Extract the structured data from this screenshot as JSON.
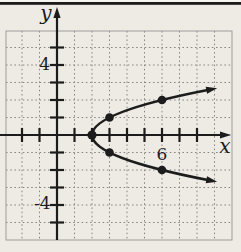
{
  "figure": {
    "width": 241,
    "height": 252,
    "colors": {
      "paper": "#eeebe4",
      "top_margin": "#f7f5f1",
      "ink": "#1c1c1c",
      "grid_dotted": "#878787",
      "plot_border": "#9d9d9d"
    },
    "top_rule": {
      "y": 2,
      "height": 2.8
    },
    "plot_box": {
      "left": 6,
      "top": 31,
      "right": 232,
      "bottom": 240
    },
    "origin_px": {
      "x": 57,
      "y": 135
    },
    "unit_px": 17.5,
    "axes_px": {
      "x_start": 0,
      "x_tip": 231,
      "y_tip": 7
    },
    "style": {
      "axis_width": 2.2,
      "tick_half_len": 7,
      "tick_width": 2.2,
      "curve_width": 2.8,
      "point_radius": 4.3,
      "vertex_radius": 4.6,
      "arrow_len": 11,
      "arrow_half_w": 3.6
    },
    "labels": [
      {
        "name": "y-axis-letter",
        "text": "y",
        "x": 46,
        "y": 20,
        "size": 20,
        "italic": true,
        "anchor": "middle"
      },
      {
        "name": "x-axis-letter",
        "text": "x",
        "x": 225,
        "y": 153,
        "size": 20,
        "italic": true,
        "anchor": "middle"
      },
      {
        "name": "y-tick-label-4",
        "text": "4",
        "x": 50,
        "y": 70,
        "size": 17,
        "italic": false,
        "anchor": "end"
      },
      {
        "name": "y-tick-label-neg4",
        "text": "-4",
        "x": 50.5,
        "y": 209,
        "size": 17,
        "italic": false,
        "anchor": "end"
      },
      {
        "name": "x-tick-label-6",
        "text": "6",
        "x": 162,
        "y": 160,
        "size": 17,
        "italic": false,
        "anchor": "middle"
      }
    ]
  },
  "chart_data": {
    "type": "line",
    "title": "",
    "xlabel": "x",
    "ylabel": "y",
    "xlim": [
      -3,
      10
    ],
    "ylim": [
      -6,
      6
    ],
    "grid": true,
    "grid_step": 1,
    "x_tick_values": [
      -2,
      -1,
      1,
      2,
      3,
      4,
      5,
      6,
      7,
      8
    ],
    "y_tick_values": [
      -5,
      -4,
      -3,
      -2,
      -1,
      1,
      2,
      3,
      4,
      5
    ],
    "tick_labels": [
      {
        "axis": "y",
        "value": 4,
        "text": "4"
      },
      {
        "axis": "y",
        "value": -4,
        "text": "-4"
      },
      {
        "axis": "x",
        "value": 6,
        "text": "6"
      }
    ],
    "series": [
      {
        "name": "parabola",
        "shape": "sideways-parabola-opening-right",
        "relation": "x = y^2 + 2",
        "vertex": [
          2,
          0
        ],
        "y_extent": 2.6,
        "arrowheads_both_ends": true,
        "marked_points": [
          [
            2,
            0
          ],
          [
            3,
            1
          ],
          [
            6,
            2
          ],
          [
            3,
            -1
          ],
          [
            6,
            -2
          ]
        ]
      }
    ]
  }
}
